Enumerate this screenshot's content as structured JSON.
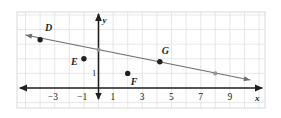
{
  "figure": {
    "type": "coordinate-plane-graph",
    "background_color": "#ffffff",
    "frame_color": "#d9d9d9",
    "grid_color": "#dcdcdc",
    "axis_color": "#231f20",
    "line_color": "#6d6e71",
    "point_color": "#231f20",
    "hollow_point_color": "#939598"
  },
  "axes": {
    "x_axis_label": "x",
    "y_axis_label": "y",
    "unit_label": "1",
    "x_ticks": [
      "−3",
      "−1",
      "1",
      "3",
      "5",
      "7",
      "9"
    ],
    "x_tick_values": [
      -3,
      -1,
      1,
      3,
      5,
      7,
      9
    ],
    "x_range": [
      -5,
      10.5
    ],
    "y_range": [
      -0.8,
      5.2
    ],
    "grid": true,
    "grid_step": 1
  },
  "points": [
    {
      "label": "D",
      "x": -4,
      "y": 3.3,
      "style": "solid",
      "label_dx": 5,
      "label_dy": -12
    },
    {
      "label": "E",
      "x": -1,
      "y": 2.0,
      "style": "solid",
      "label_dx": -13,
      "label_dy": 3
    },
    {
      "label": "F",
      "x": 2,
      "y": 1.0,
      "style": "solid",
      "label_dx": 3,
      "label_dy": 9
    },
    {
      "label": "G",
      "x": 4.2,
      "y": 1.8,
      "style": "solid",
      "label_dx": 2,
      "label_dy": -11
    }
  ],
  "line_markers": [
    {
      "x": 0,
      "y": 2.63,
      "style": "small"
    },
    {
      "x": 8,
      "y": 1.0,
      "style": "small"
    }
  ],
  "line": {
    "description": "line through D and G with negative slope",
    "slope": -0.2,
    "y_intercept": 2.63,
    "x_start": -5.0,
    "x_end": 10.4,
    "arrow_start": true,
    "arrow_end": true
  },
  "chart_data": {
    "type": "scatter",
    "title": "",
    "xlabel": "x",
    "ylabel": "y",
    "xlim": [
      -5,
      10.5
    ],
    "ylim": [
      -0.8,
      5.2
    ],
    "grid": true,
    "x_ticks": [
      -3,
      -1,
      1,
      3,
      5,
      7,
      9
    ],
    "series": [
      {
        "name": "labeled points",
        "points": [
          {
            "label": "D",
            "x": -4,
            "y": 3.3
          },
          {
            "label": "E",
            "x": -1,
            "y": 2.0
          },
          {
            "label": "F",
            "x": 2,
            "y": 1.0
          },
          {
            "label": "G",
            "x": 4.2,
            "y": 1.8
          }
        ]
      },
      {
        "name": "line",
        "slope": -0.2,
        "intercept": 2.63,
        "x_from": -5.0,
        "x_to": 10.4
      }
    ]
  }
}
